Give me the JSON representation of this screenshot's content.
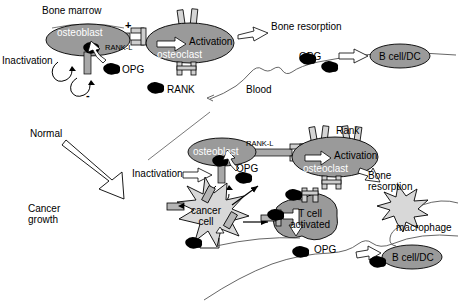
{
  "figure": {
    "type": "diagram",
    "background_color": "#ffffff",
    "line_color": "#000000",
    "cell_fill_gray": "#9a9a9a",
    "cell_fill_light": "#d8d8d8",
    "bar_fill_gray": "#a8a8a8"
  },
  "panel_top": {
    "title": "Bone marrow",
    "osteoblast_label": "osteoblast",
    "osteoclast_label": "osteoclast",
    "rankl_label": "RANK-L",
    "rank_label": "RANK",
    "opg_label": "OPG",
    "activation_label": "Activation",
    "inactivation_label": "Inactivation",
    "bone_resorption_label": "Bone resorption",
    "blood_label": "Blood",
    "bcell_label": "B cell/DC",
    "plus_sign": "+",
    "minus_sign": "-"
  },
  "transition": {
    "from_label": "Normal",
    "to_label_line1": "Cancer",
    "to_label_line2": "growth"
  },
  "panel_bottom": {
    "osteoblast_label": "osteoblast",
    "osteoclast_label": "osteoclast",
    "rankl_label": "RANK-L",
    "rank_label": "Rank",
    "opg_label": "OPG",
    "opg_label_2": "OPG",
    "activation_label": "Activation",
    "inactivation_label": "Inactivation",
    "bone_resorption_line1": "Bone",
    "bone_resorption_line2": "resorption",
    "cancer_cell_line1": "cancer",
    "cancer_cell_line2": "cell",
    "tcell_line1": "T cell",
    "tcell_line2": "activated",
    "macrophage_label": "macrophage",
    "bcell_label": "B cell/DC"
  }
}
